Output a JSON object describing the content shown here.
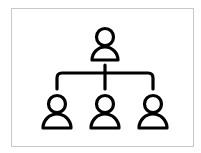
{
  "icon": {
    "name": "org-chart-icon",
    "stroke_color": "#000000",
    "border_color": "#c8c8c8",
    "background": "#ffffff",
    "nodes": [
      {
        "role": "parent",
        "cx": 105,
        "head_cy": 37
      },
      {
        "role": "child",
        "cx": 57,
        "head_cy": 104
      },
      {
        "role": "child",
        "cx": 105,
        "head_cy": 104
      },
      {
        "role": "child",
        "cx": 153,
        "head_cy": 104
      }
    ]
  }
}
